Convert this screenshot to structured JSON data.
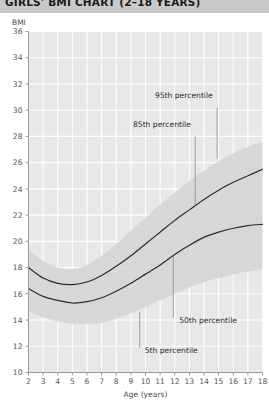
{
  "title": "GIRLS' BMI CHART (2–18 YEARS)",
  "axes": {
    "y_label": "BMI",
    "x_label": "Age (years)",
    "y_ticks": [
      36,
      34,
      32,
      30,
      28,
      26,
      24,
      22,
      20,
      18,
      16,
      14,
      12,
      10
    ],
    "x_ticks": [
      2,
      3,
      4,
      5,
      6,
      7,
      8,
      9,
      10,
      11,
      12,
      13,
      14,
      15,
      16,
      17,
      18
    ]
  },
  "annotations": {
    "p95": "95th percentile",
    "p85": "85th percentile",
    "p50": "50th percentile",
    "p5": "5th percentile"
  },
  "colors": {
    "title_bar": "#c9c9c9",
    "plot_bg": "#e8e8e8",
    "gridline": "#ffffff",
    "curve": "#2b2b2b",
    "band": "#d2d2d2",
    "axis": "#9a9a9a"
  },
  "chart_data": {
    "type": "line",
    "title": "GIRLS' BMI CHART (2–18 YEARS)",
    "xlabel": "Age (years)",
    "ylabel": "BMI",
    "xlim": [
      2,
      18
    ],
    "ylim": [
      10,
      36
    ],
    "grid": true,
    "legend": "inline-annotations",
    "x": [
      2,
      3,
      4,
      5,
      6,
      7,
      8,
      9,
      10,
      11,
      12,
      13,
      14,
      15,
      16,
      17,
      18
    ],
    "series": [
      {
        "name": "95th percentile",
        "style": "band-upper",
        "values": [
          19.4,
          18.5,
          18.0,
          17.9,
          18.2,
          18.9,
          19.8,
          20.8,
          21.8,
          22.8,
          23.7,
          24.6,
          25.4,
          26.1,
          26.7,
          27.2,
          27.6
        ]
      },
      {
        "name": "85th percentile",
        "style": "solid",
        "values": [
          18.0,
          17.2,
          16.8,
          16.7,
          16.9,
          17.4,
          18.1,
          18.9,
          19.8,
          20.7,
          21.6,
          22.4,
          23.2,
          23.9,
          24.5,
          25.0,
          25.5
        ]
      },
      {
        "name": "50th percentile",
        "style": "solid",
        "values": [
          16.4,
          15.8,
          15.5,
          15.3,
          15.4,
          15.7,
          16.2,
          16.8,
          17.5,
          18.2,
          19.0,
          19.7,
          20.3,
          20.7,
          21.0,
          21.2,
          21.3
        ]
      },
      {
        "name": "5th percentile",
        "style": "band-lower",
        "values": [
          14.7,
          14.2,
          13.9,
          13.7,
          13.7,
          13.8,
          14.1,
          14.5,
          15.0,
          15.5,
          16.0,
          16.5,
          16.9,
          17.2,
          17.5,
          17.7,
          17.9
        ]
      }
    ]
  }
}
